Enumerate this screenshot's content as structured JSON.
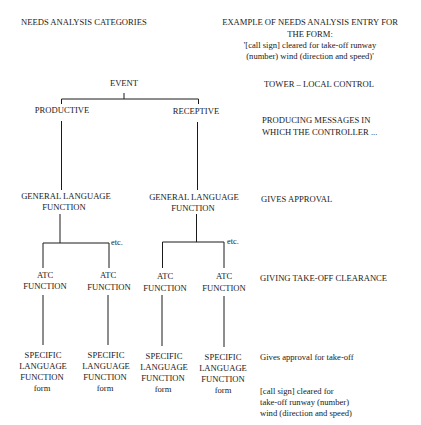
{
  "headers": {
    "left": "NEEDS ANALYSIS CATEGORIES",
    "right_line1": "EXAMPLE OF NEEDS ANALYSIS ENTRY FOR",
    "right_line2": "THE FORM:",
    "right_line3": "'[call sign] cleared for take-off runway",
    "right_line4": "(number) wind (direction and speed)'"
  },
  "tree": {
    "root": "EVENT",
    "level1": [
      "PRODUCTIVE",
      "RECEPTIVE"
    ],
    "level2": [
      {
        "line1": "GENERAL LANGUAGE",
        "line2": "FUNCTION"
      },
      {
        "line1": "GENERAL LANGUAGE",
        "line2": "FUNCTION"
      }
    ],
    "etc_label": "etc.",
    "level3": [
      {
        "line1": "ATC",
        "line2": "FUNCTION"
      },
      {
        "line1": "ATC",
        "line2": "FUNCTION"
      },
      {
        "line1": "ATC",
        "line2": "FUNCTION"
      },
      {
        "line1": "ATC",
        "line2": "FUNCTION"
      }
    ],
    "level4": [
      {
        "line1": "SPECIFIC",
        "line2": "LANGUAGE",
        "line3": "FUNCTION",
        "line4": "form"
      },
      {
        "line1": "SPECIFIC",
        "line2": "LANGUAGE",
        "line3": "FUNCTION",
        "line4": "form"
      },
      {
        "line1": "SPECIFIC",
        "line2": "LANGUAGE",
        "line3": "FUNCTION",
        "line4": "form"
      },
      {
        "line1": "SPECIFIC",
        "line2": "LANGUAGE",
        "line3": "FUNCTION",
        "line4": "form"
      }
    ]
  },
  "examples": {
    "event": "TOWER – LOCAL CONTROL",
    "mode_line1": "PRODUCING MESSAGES IN",
    "mode_line2": "WHICH THE CONTROLLER ...",
    "general": "GIVES APPROVAL",
    "atc": "GIVING TAKE-OFF CLEARANCE",
    "specific": "Gives approval for take-off",
    "form_line1": "[call sign] cleared for",
    "form_line2": "take-off runway (number)",
    "form_line3": "wind (direction and speed)"
  },
  "colors": {
    "line": "#1a1a1a",
    "text": "#1a1a1a",
    "background": "#ffffff"
  }
}
